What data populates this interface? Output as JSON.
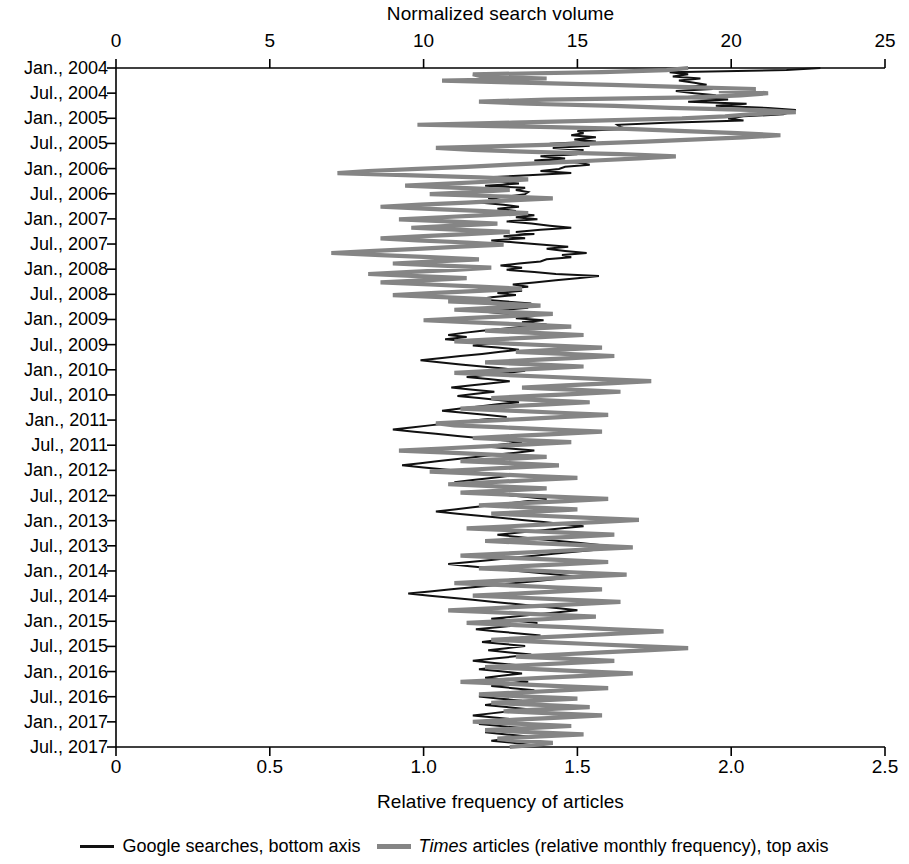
{
  "chart_data": {
    "type": "line",
    "title": "Normalized search volume",
    "top_axis": {
      "label": "Normalized search volume",
      "ticks": [
        0,
        5,
        10,
        15,
        20,
        25
      ],
      "tick_labels": [
        "0",
        "5",
        "10",
        "15",
        "20",
        "25"
      ],
      "range": [
        0,
        25
      ]
    },
    "bottom_axis": {
      "label": "Relative frequency of articles",
      "ticks": [
        0,
        0.5,
        1.0,
        1.5,
        2.0,
        2.5
      ],
      "tick_labels": [
        "0",
        "0.5",
        "1.0",
        "1.5",
        "2.0",
        "2.5"
      ],
      "range": [
        0,
        2.5
      ]
    },
    "y_axis": {
      "label": "",
      "orientation": "vertical-descending",
      "tick_labels": [
        "Jan., 2004",
        "Jul., 2004",
        "Jan., 2005",
        "Jul., 2005",
        "Jan., 2006",
        "Jul., 2006",
        "Jan., 2007",
        "Jul., 2007",
        "Jan., 2008",
        "Jul., 2008",
        "Jan., 2009",
        "Jul., 2009",
        "Jan., 2010",
        "Jul., 2010",
        "Jan., 2011",
        "Jul., 2011",
        "Jan., 2012",
        "Jul., 2012",
        "Jan., 2013",
        "Jul., 2013",
        "Jan., 2014",
        "Jul., 2014",
        "Jan., 2015",
        "Jul., 2015",
        "Jan., 2016",
        "Jul., 2016",
        "Jan., 2017",
        "Jul., 2017"
      ],
      "range": [
        "Jan., 2004",
        "Jul., 2017"
      ]
    },
    "grid": false,
    "legend_position": "bottom",
    "series": [
      {
        "name": "Google searches, bottom axis",
        "axis": "bottom",
        "color": "#111111",
        "values": [
          2.29,
          2.18,
          1.8,
          1.86,
          1.81,
          1.9,
          1.83,
          1.88,
          1.92,
          1.86,
          1.94,
          1.82,
          1.88,
          1.95,
          1.83,
          1.99,
          1.86,
          2.05,
          1.95,
          2.12,
          2.21,
          2.19,
          2.17,
          2.04,
          1.99,
          2.04,
          1.79,
          1.63,
          1.64,
          1.66,
          1.5,
          1.52,
          1.48,
          1.56,
          1.49,
          1.56,
          1.41,
          1.54,
          1.42,
          1.52,
          1.43,
          1.5,
          1.38,
          1.46,
          1.36,
          1.5,
          1.54,
          1.46,
          1.44,
          1.38,
          1.48,
          1.34,
          1.21,
          1.28,
          1.24,
          1.31,
          1.2,
          1.33,
          1.3,
          1.34,
          1.33,
          1.28,
          1.21,
          1.26,
          1.18,
          1.26,
          1.31,
          1.24,
          1.3,
          1.27,
          1.36,
          1.3,
          1.37,
          1.27,
          1.35,
          1.41,
          1.48,
          1.38,
          1.3,
          1.36,
          1.26,
          1.33,
          1.22,
          1.3,
          1.38,
          1.47,
          1.4,
          1.46,
          1.53,
          1.45,
          1.48,
          1.4,
          1.38,
          1.31,
          1.25,
          1.32,
          1.27,
          1.36,
          1.43,
          1.57,
          1.5,
          1.43,
          1.36,
          1.29,
          1.34,
          1.25,
          1.32,
          1.24,
          1.3,
          1.22,
          1.18,
          1.26,
          1.35,
          1.28,
          1.34,
          1.27,
          1.2,
          1.28,
          1.36,
          1.3,
          1.39,
          1.32,
          1.4,
          1.33,
          1.26,
          1.19,
          1.13,
          1.08,
          1.14,
          1.07,
          1.15,
          1.22,
          1.16,
          1.24,
          1.31,
          1.25,
          1.19,
          1.12,
          1.06,
          0.99,
          1.05,
          1.12,
          1.19,
          1.26,
          1.33,
          1.27,
          1.2,
          1.14,
          1.21,
          1.28,
          1.22,
          1.15,
          1.09,
          1.16,
          1.23,
          1.17,
          1.11,
          1.18,
          1.25,
          1.31,
          1.24,
          1.18,
          1.12,
          1.06,
          1.13,
          1.2,
          1.27,
          1.21,
          1.14,
          1.08,
          1.02,
          0.96,
          0.9,
          0.97,
          1.04,
          1.11,
          1.18,
          1.25,
          1.32,
          1.26,
          1.2,
          1.28,
          1.36,
          1.3,
          1.23,
          1.17,
          1.11,
          1.05,
          0.99,
          0.93,
          1.0,
          1.07,
          1.14,
          1.21,
          1.28,
          1.22,
          1.16,
          1.1,
          1.17,
          1.24,
          1.3,
          1.24,
          1.18,
          1.26,
          1.33,
          1.4,
          1.34,
          1.28,
          1.22,
          1.16,
          1.1,
          1.04,
          1.11,
          1.18,
          1.25,
          1.32,
          1.39,
          1.46,
          1.52,
          1.45,
          1.38,
          1.31,
          1.24,
          1.3,
          1.37,
          1.44,
          1.51,
          1.58,
          1.64,
          1.57,
          1.5,
          1.43,
          1.36,
          1.29,
          1.22,
          1.15,
          1.08,
          1.15,
          1.22,
          1.29,
          1.36,
          1.43,
          1.5,
          1.44,
          1.37,
          1.3,
          1.23,
          1.16,
          1.09,
          1.02,
          0.95,
          1.02,
          1.09,
          1.16,
          1.23,
          1.3,
          1.37,
          1.44,
          1.5,
          1.43,
          1.36,
          1.29,
          1.22,
          1.3,
          1.37,
          1.31,
          1.24,
          1.17,
          1.24,
          1.31,
          1.38,
          1.32,
          1.25,
          1.19,
          1.26,
          1.33,
          1.27,
          1.21,
          1.28,
          1.35,
          1.29,
          1.22,
          1.16,
          1.23,
          1.3,
          1.24,
          1.18,
          1.25,
          1.32,
          1.26,
          1.2,
          1.27,
          1.34,
          1.28,
          1.22,
          1.29,
          1.36,
          1.3,
          1.24,
          1.18,
          1.25,
          1.32,
          1.26,
          1.2,
          1.27,
          1.34,
          1.28,
          1.22,
          1.16,
          1.23,
          1.3,
          1.24,
          1.18,
          1.25,
          1.32,
          1.26,
          1.2,
          1.27,
          1.34,
          1.28,
          1.22,
          1.29,
          1.35,
          1.3
        ]
      },
      {
        "name": "Times articles (relative monthly frequency), top axis",
        "axis": "top",
        "color": "#858585",
        "values": [
          18.6,
          17.9,
          15.8,
          11.6,
          11.9,
          14.0,
          10.6,
          13.2,
          16.1,
          18.3,
          20.8,
          19.6,
          21.2,
          20.3,
          18.8,
          14.0,
          11.8,
          13.4,
          16.2,
          18.0,
          20.9,
          22.1,
          20.6,
          19.8,
          18.4,
          15.6,
          12.9,
          9.8,
          13.8,
          16.6,
          18.5,
          20.2,
          21.6,
          20.4,
          18.9,
          17.2,
          15.4,
          12.8,
          10.4,
          11.6,
          13.8,
          16.4,
          18.2,
          17.0,
          15.6,
          14.2,
          12.8,
          11.4,
          9.8,
          8.2,
          7.2,
          9.4,
          11.8,
          13.4,
          12.2,
          10.8,
          9.4,
          11.2,
          12.8,
          11.6,
          10.2,
          12.4,
          14.2,
          12.8,
          11.4,
          9.9,
          8.6,
          10.2,
          11.8,
          13.4,
          12.0,
          10.6,
          9.2,
          10.8,
          12.4,
          11.0,
          9.6,
          11.2,
          12.8,
          11.4,
          10.0,
          8.6,
          9.8,
          11.4,
          12.6,
          11.2,
          9.8,
          8.4,
          7.0,
          8.6,
          10.2,
          11.8,
          10.4,
          9.0,
          10.6,
          12.2,
          11.0,
          9.6,
          8.2,
          9.8,
          11.4,
          10.0,
          8.6,
          10.2,
          11.8,
          13.2,
          11.8,
          10.4,
          9.0,
          10.6,
          12.2,
          10.8,
          12.4,
          13.8,
          12.4,
          11.0,
          12.6,
          14.2,
          12.8,
          11.4,
          10.0,
          11.6,
          13.2,
          14.8,
          13.4,
          12.0,
          13.6,
          15.2,
          13.8,
          12.4,
          11.0,
          12.6,
          14.2,
          15.8,
          14.4,
          13.0,
          14.6,
          16.2,
          14.8,
          13.4,
          12.0,
          13.6,
          15.2,
          13.8,
          12.4,
          11.0,
          12.6,
          14.2,
          15.8,
          17.4,
          16.0,
          14.6,
          13.2,
          14.8,
          16.4,
          15.0,
          13.6,
          12.2,
          13.8,
          15.4,
          14.0,
          12.6,
          11.2,
          12.8,
          14.4,
          16.0,
          14.6,
          13.2,
          11.8,
          10.4,
          11.0,
          12.6,
          14.2,
          15.8,
          14.4,
          13.0,
          11.6,
          13.2,
          14.8,
          13.4,
          12.0,
          10.6,
          9.2,
          10.8,
          12.4,
          14.0,
          12.6,
          11.2,
          12.8,
          14.4,
          13.0,
          11.6,
          10.2,
          11.8,
          13.4,
          15.0,
          13.6,
          12.2,
          10.8,
          12.4,
          14.0,
          12.6,
          11.2,
          12.8,
          14.4,
          16.0,
          14.6,
          13.2,
          11.8,
          13.4,
          15.0,
          13.6,
          12.2,
          13.8,
          15.4,
          17.0,
          15.6,
          14.2,
          12.8,
          11.4,
          13.0,
          14.6,
          16.2,
          14.8,
          13.4,
          12.0,
          13.6,
          15.2,
          16.8,
          15.4,
          14.0,
          12.6,
          11.2,
          12.8,
          14.4,
          16.0,
          14.6,
          13.2,
          11.8,
          13.4,
          15.0,
          16.6,
          15.2,
          13.8,
          12.4,
          11.0,
          12.6,
          14.2,
          15.8,
          14.4,
          13.0,
          11.6,
          13.2,
          14.8,
          16.4,
          15.0,
          13.6,
          12.2,
          10.8,
          12.4,
          14.0,
          15.6,
          14.2,
          12.8,
          11.4,
          13.0,
          14.6,
          16.2,
          17.8,
          16.4,
          15.0,
          13.6,
          12.2,
          13.8,
          15.4,
          17.0,
          18.6,
          17.2,
          15.8,
          14.4,
          13.0,
          14.6,
          16.2,
          14.8,
          13.4,
          12.0,
          13.6,
          15.2,
          16.8,
          15.4,
          14.0,
          12.6,
          11.2,
          12.8,
          14.4,
          16.0,
          14.6,
          13.2,
          11.8,
          13.4,
          15.0,
          13.6,
          12.2,
          13.8,
          15.4,
          14.0,
          12.6,
          14.2,
          15.8,
          14.4,
          13.0,
          11.6,
          13.2,
          14.8,
          13.4,
          12.0,
          13.6,
          15.2,
          13.8,
          12.4,
          13.0,
          14.2,
          13.6,
          12.8
        ]
      }
    ]
  },
  "legend": {
    "entries": [
      {
        "label": "Google searches, bottom axis",
        "color": "#111111",
        "italic_prefix": ""
      },
      {
        "label": " articles (relative monthly frequency), top axis",
        "color": "#858585",
        "italic_prefix": "Times"
      }
    ]
  }
}
